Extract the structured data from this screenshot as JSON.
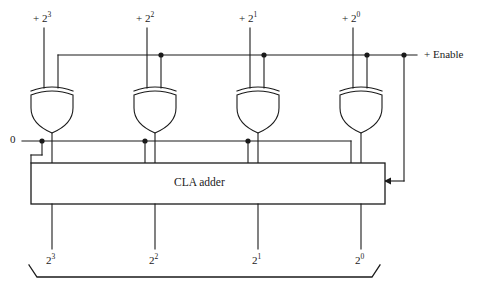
{
  "diagram": {
    "block": {
      "label": "CLA adder"
    },
    "control": {
      "enable_label": "+ Enable",
      "zero_label": "0"
    },
    "inputs": [
      {
        "label": "+ 2",
        "exponent": "3"
      },
      {
        "label": "+ 2",
        "exponent": "2"
      },
      {
        "label": "+ 2",
        "exponent": "1"
      },
      {
        "label": "+ 2",
        "exponent": "0"
      }
    ],
    "outputs": [
      {
        "label": "2",
        "exponent": "3"
      },
      {
        "label": "2",
        "exponent": "2"
      },
      {
        "label": "2",
        "exponent": "1"
      },
      {
        "label": "2",
        "exponent": "0"
      }
    ],
    "gates": [
      {
        "type": "xor",
        "name": "xor-gate-bit3"
      },
      {
        "type": "xor",
        "name": "xor-gate-bit2"
      },
      {
        "type": "xor",
        "name": "xor-gate-bit1"
      },
      {
        "type": "xor",
        "name": "xor-gate-bit0"
      }
    ],
    "colors": {
      "line": "#1a1a1a",
      "background": "#ffffff",
      "text": "#1a1a1a"
    }
  }
}
